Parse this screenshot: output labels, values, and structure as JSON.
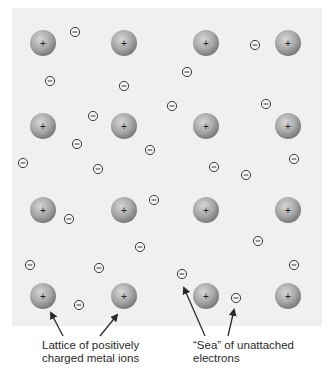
{
  "diagram": {
    "colors": {
      "panel": "#f0f0f0",
      "ion_light": "#d2d2d2",
      "ion_dark": "#7d7d7d",
      "electron_stroke": "#3a3a3a",
      "arrow": "#2a2a2a",
      "text": "#2a2a2a"
    },
    "ion_symbol": "+",
    "electron_symbol": "−",
    "ions": [
      {
        "row": 1,
        "col": 1
      },
      {
        "row": 1,
        "col": 2
      },
      {
        "row": 1,
        "col": 3
      },
      {
        "row": 1,
        "col": 4
      },
      {
        "row": 2,
        "col": 1
      },
      {
        "row": 2,
        "col": 2
      },
      {
        "row": 2,
        "col": 3
      },
      {
        "row": 2,
        "col": 4
      },
      {
        "row": 3,
        "col": 1
      },
      {
        "row": 3,
        "col": 2
      },
      {
        "row": 3,
        "col": 3
      },
      {
        "row": 3,
        "col": 4
      },
      {
        "row": 4,
        "col": 1
      },
      {
        "row": 4,
        "col": 2
      },
      {
        "row": 4,
        "col": 3
      },
      {
        "row": 4,
        "col": 4
      }
    ],
    "electron_count": 25,
    "labels": [
      {
        "id": "lattice",
        "lines": [
          "Lattice of positively",
          "charged metal ions"
        ],
        "points_to": "metal-ions"
      },
      {
        "id": "sea",
        "lines": [
          "“Sea” of unattached",
          "electrons"
        ],
        "points_to": "electrons"
      }
    ]
  }
}
